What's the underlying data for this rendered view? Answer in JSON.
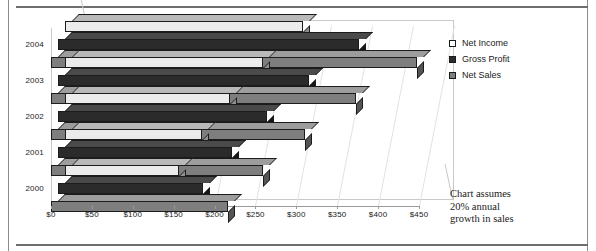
{
  "chart_data": {
    "type": "bar",
    "orientation": "horizontal",
    "title": "",
    "xlabel": "",
    "ylabel": "",
    "categories": [
      "2000",
      "2001",
      "2002",
      "2003",
      "2004"
    ],
    "series": [
      {
        "name": "Net Income",
        "color": "#ececec",
        "values": [
          140,
          168,
          202,
          242,
          291
        ]
      },
      {
        "name": "Gross Profit",
        "color": "#2b2b2b",
        "values": [
          177,
          213,
          256,
          307,
          368
        ]
      },
      {
        "name": "Net Sales",
        "color": "#7e7e7e",
        "values": [
          216,
          259,
          311,
          373,
          448
        ]
      }
    ],
    "xlim": [
      0,
      450
    ],
    "xticks": [
      0,
      50,
      100,
      150,
      200,
      250,
      300,
      350,
      400,
      450
    ],
    "xtick_labels": [
      "$0",
      "$50",
      "$100",
      "$150",
      "$200",
      "$250",
      "$300",
      "$350",
      "$400",
      "$450"
    ],
    "grid": true,
    "legend_position": "right",
    "three_d": true,
    "annotation": "Chart assumes 20% annual growth in sales"
  },
  "legend": {
    "items": [
      {
        "label": "Net Income",
        "swatch": "#ececec"
      },
      {
        "label": "Gross Profit",
        "swatch": "#2b2b2b"
      },
      {
        "label": "Net Sales",
        "swatch": "#7e7e7e"
      }
    ]
  },
  "annotation": {
    "line1": "Chart assumes",
    "line2": "20% annual",
    "line3": "growth in sales"
  },
  "axis": {
    "y_labels": [
      "2004",
      "2003",
      "2002",
      "2001",
      "2000"
    ],
    "x_labels": [
      "$0",
      "$50",
      "$100",
      "$150",
      "$200",
      "$250",
      "$300",
      "$350",
      "$400",
      "$450"
    ]
  }
}
